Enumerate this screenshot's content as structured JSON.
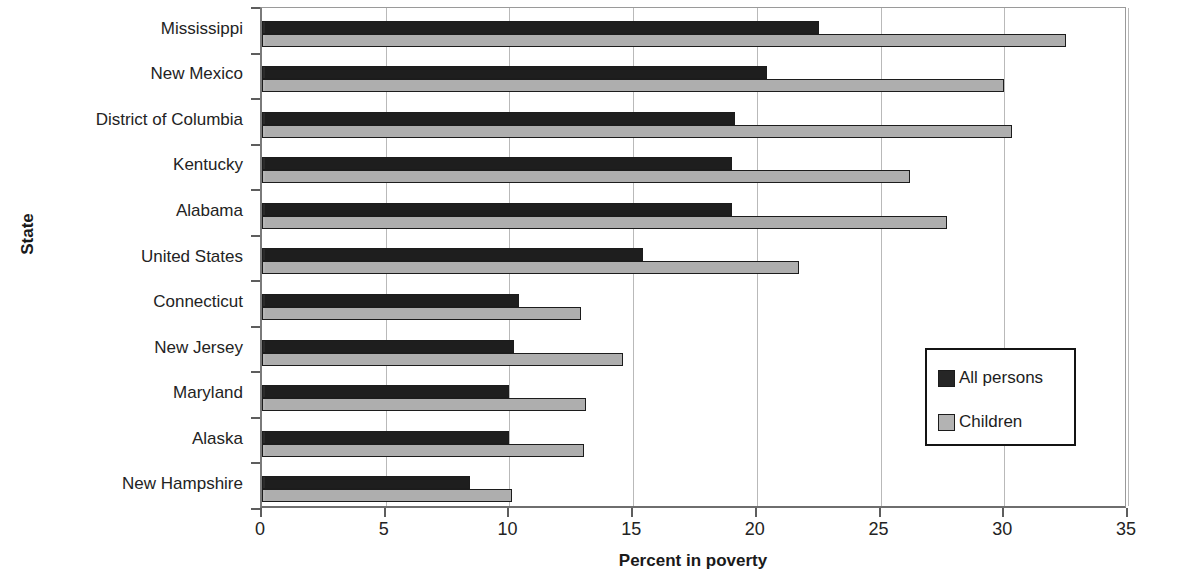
{
  "chart_data": {
    "type": "bar",
    "orientation": "horizontal",
    "title": "",
    "xlabel": "Percent in poverty",
    "ylabel": "State",
    "xlim": [
      0,
      35
    ],
    "xticks": [
      0,
      5,
      10,
      15,
      20,
      25,
      30,
      35
    ],
    "grid": true,
    "grid_axis": "x",
    "legend_position": "center-right",
    "categories": [
      "Mississippi",
      "New Mexico",
      "District of Columbia",
      "Kentucky",
      "Alabama",
      "United States",
      "Connecticut",
      "New Jersey",
      "Maryland",
      "Alaska",
      "New Hampshire"
    ],
    "series": [
      {
        "name": "All persons",
        "color": "#262626",
        "values": [
          22.5,
          20.4,
          19.1,
          19.0,
          19.0,
          15.4,
          10.4,
          10.2,
          10.0,
          10.0,
          8.4
        ]
      },
      {
        "name": "Children",
        "color": "#b3b3b3",
        "values": [
          32.5,
          30.0,
          30.3,
          26.2,
          27.7,
          21.7,
          12.9,
          14.6,
          13.1,
          13.0,
          10.1
        ]
      }
    ]
  },
  "axis": {
    "x_tick_labels": [
      "0",
      "5",
      "10",
      "15",
      "20",
      "25",
      "30",
      "35"
    ],
    "x_title": "Percent in poverty",
    "y_title": "State"
  },
  "legend": {
    "entries": [
      {
        "label": "All persons",
        "swatch": "all"
      },
      {
        "label": "Children",
        "swatch": "children"
      }
    ]
  }
}
